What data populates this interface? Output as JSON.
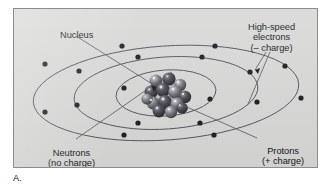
{
  "figure": {
    "caption": "A."
  },
  "labels": {
    "nucleus": "Nucleus",
    "electrons_line1": "High-speed",
    "electrons_line2": "electrons",
    "electrons_line3": "(– charge)",
    "neutrons_line1": "Neutrons",
    "neutrons_line2": "(no charge)",
    "protons_line1": "Protons",
    "protons_line2": "(+ charge)"
  },
  "colors": {
    "panel_background": "#d8d8d6",
    "panel_border": "#8c8c8c",
    "orbit_line": "#4a4a52",
    "electron_dot": "#1b1b20",
    "leader_line": "#5a5a62",
    "proton_sphere": "#3b3b42",
    "neutron_sphere": "#6e6e77",
    "text": "#15161a",
    "page_background": "#ffffff"
  },
  "diagram": {
    "center": {
      "x": 165,
      "y": 92
    },
    "orbits": [
      {
        "name": "inner-orbit",
        "rx": 50,
        "ry": 23,
        "tilt_deg": -4,
        "electron_count": 2
      },
      {
        "name": "middle-orbit",
        "rx": 92,
        "ry": 36,
        "tilt_deg": -4,
        "electron_count": 8
      },
      {
        "name": "outer-orbit",
        "rx": 133,
        "ry": 47,
        "tilt_deg": -4,
        "electron_count": 8
      }
    ],
    "electron_total": 18,
    "nucleus": {
      "sphere_count": 14,
      "proton_count": 7,
      "neutron_count": 7,
      "radius_px": 16
    }
  }
}
